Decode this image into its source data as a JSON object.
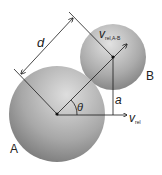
{
  "diagram": {
    "labels": {
      "sphere_a": "A",
      "sphere_b": "B",
      "distance": "d",
      "angle": "θ",
      "offset": "a",
      "v_rel_main": "v",
      "v_rel_main_sub": "rel",
      "v_rel_ab_main": "v",
      "v_rel_ab_sub": "rel,A-B"
    },
    "colors": {
      "sphere_light": "#e6e6e6",
      "sphere_dark": "#6e6e6e",
      "line": "#1a1a1a",
      "text": "#222222"
    }
  }
}
